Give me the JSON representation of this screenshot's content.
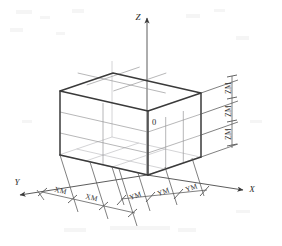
{
  "figure": {
    "kind": "isometric-grid-box-diagram",
    "background_color": "#ffffff",
    "edge_color": "#3a3a3a",
    "grid_color": "#8f8f92",
    "dimension_color": "#555555",
    "text_color": "#2b2b2b"
  },
  "axes": {
    "z": {
      "label": "Z",
      "direction": "up",
      "arrow": true
    },
    "x": {
      "label": "X",
      "direction": "down-right",
      "arrow": true
    },
    "y": {
      "label": "Y",
      "direction": "down-left",
      "arrow": true
    },
    "origin": {
      "label": "0"
    }
  },
  "mesh": {
    "divisions_x": 3,
    "divisions_y": 2,
    "divisions_z": 3
  },
  "dimensions": {
    "z_axis": {
      "label_text": "ZM",
      "count": 3,
      "orientation": "vertical-rotated",
      "labels": [
        "ZM",
        "ZM",
        "ZM"
      ]
    },
    "x_axis": {
      "label_text": "YM",
      "count": 3,
      "orientation": "isometric-right",
      "labels": [
        "YM",
        "YM",
        "YM"
      ]
    },
    "y_axis": {
      "label_text": "XM",
      "count": 2,
      "orientation": "isometric-left",
      "labels": [
        "XM",
        "XM"
      ]
    }
  }
}
